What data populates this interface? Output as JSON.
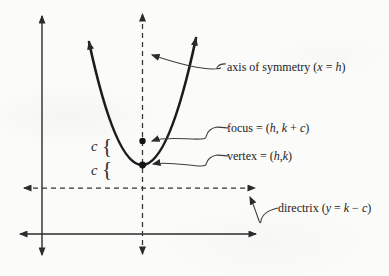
{
  "diagram": {
    "ink_color": "#222222",
    "labels": {
      "axis_of_symmetry": [
        "axis of symmetry (",
        "x",
        " = ",
        "h",
        ")"
      ],
      "focus": [
        "focus = (",
        "h",
        ", ",
        "k",
        " + ",
        "c",
        ")"
      ],
      "vertex": [
        "vertex = (",
        "h",
        ",",
        "k",
        ")"
      ],
      "directrix": [
        "directrix (",
        "y",
        " = ",
        "k",
        " − ",
        "c",
        ")"
      ],
      "distance_upper": "c",
      "distance_lower": "c",
      "brace_glyph": "{"
    }
  }
}
